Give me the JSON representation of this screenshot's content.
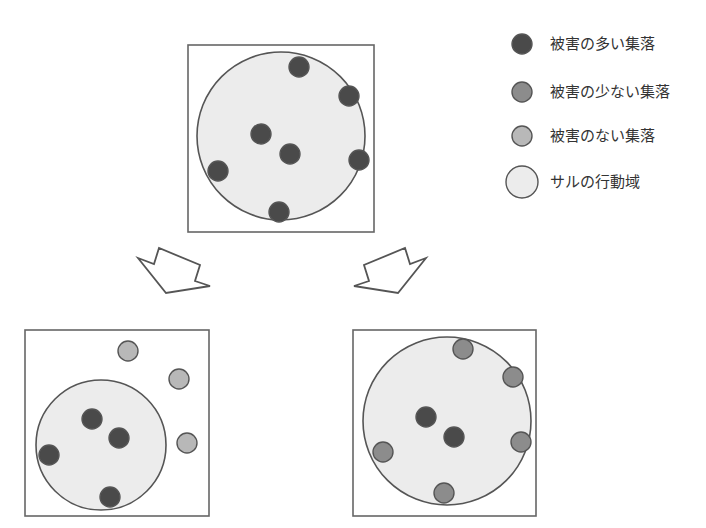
{
  "colors": {
    "many_damage": "#4a4a4a",
    "few_damage": "#8c8c8c",
    "no_damage": "#b8b8b8",
    "range_fill": "#ececec",
    "stroke": "#555555",
    "frame": "#666666"
  },
  "legend": {
    "items": [
      {
        "key": "many_damage",
        "label": "被害の多い集落",
        "cx": 522,
        "cy": 44,
        "r": 10
      },
      {
        "key": "few_damage",
        "label": "被害の少ない集落",
        "cx": 522,
        "cy": 92,
        "r": 10
      },
      {
        "key": "no_damage",
        "label": "被害のない集落",
        "cx": 522,
        "cy": 136,
        "r": 10
      },
      {
        "key": "range_fill",
        "label": "サルの行動域",
        "cx": 522,
        "cy": 182,
        "r": 16
      }
    ]
  },
  "panels": [
    {
      "id": "top",
      "frame": {
        "x": 188,
        "y": 45,
        "w": 186,
        "h": 187
      },
      "range": {
        "cx": 281,
        "cy": 136,
        "r": 84
      },
      "dots": [
        {
          "x": 299,
          "y": 67,
          "type": "many_damage"
        },
        {
          "x": 349,
          "y": 96,
          "type": "many_damage"
        },
        {
          "x": 261,
          "y": 134,
          "type": "many_damage"
        },
        {
          "x": 290,
          "y": 154,
          "type": "many_damage"
        },
        {
          "x": 359,
          "y": 160,
          "type": "many_damage"
        },
        {
          "x": 218,
          "y": 171,
          "type": "many_damage"
        },
        {
          "x": 279,
          "y": 212,
          "type": "many_damage"
        }
      ]
    },
    {
      "id": "bottom-left",
      "frame": {
        "x": 25,
        "y": 330,
        "w": 184,
        "h": 186
      },
      "range": {
        "cx": 101,
        "cy": 445,
        "r": 65
      },
      "dots": [
        {
          "x": 128,
          "y": 351,
          "type": "no_damage"
        },
        {
          "x": 179,
          "y": 379,
          "type": "no_damage"
        },
        {
          "x": 187,
          "y": 443,
          "type": "no_damage"
        },
        {
          "x": 92,
          "y": 419,
          "type": "many_damage"
        },
        {
          "x": 119,
          "y": 438,
          "type": "many_damage"
        },
        {
          "x": 49,
          "y": 455,
          "type": "many_damage"
        },
        {
          "x": 110,
          "y": 497,
          "type": "many_damage"
        }
      ]
    },
    {
      "id": "bottom-right",
      "frame": {
        "x": 353,
        "y": 330,
        "w": 183,
        "h": 186
      },
      "range": {
        "cx": 447,
        "cy": 421,
        "r": 84
      },
      "dots": [
        {
          "x": 463,
          "y": 349,
          "type": "few_damage"
        },
        {
          "x": 513,
          "y": 377,
          "type": "few_damage"
        },
        {
          "x": 521,
          "y": 442,
          "type": "few_damage"
        },
        {
          "x": 383,
          "y": 452,
          "type": "few_damage"
        },
        {
          "x": 444,
          "y": 493,
          "type": "few_damage"
        },
        {
          "x": 426,
          "y": 417,
          "type": "many_damage"
        },
        {
          "x": 454,
          "y": 437,
          "type": "many_damage"
        }
      ]
    }
  ],
  "arrows": [
    {
      "id": "arrow-left",
      "points": "138,258 154,264 159,248 200,265 195,281 210,286 166,293"
    },
    {
      "id": "arrow-right",
      "points": "426,258 410,264 405,248 364,265 369,281 354,286 398,293"
    }
  ],
  "dot_radius": 10
}
